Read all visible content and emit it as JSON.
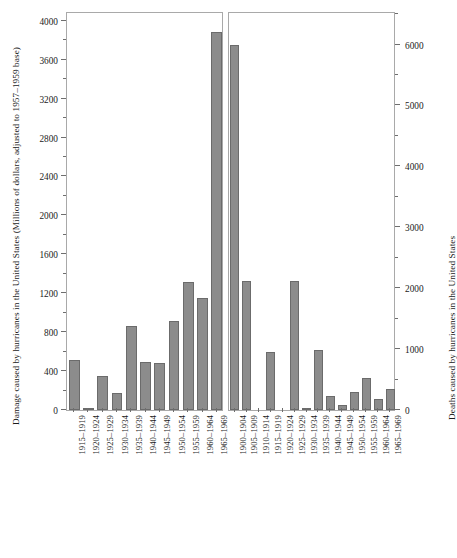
{
  "chart_data": {
    "type": "bar",
    "title": "",
    "panels": [
      {
        "id": "damage",
        "ylabel": "Damage caused by hurricanes in the United States (Millions of dollars, adjusted to 1957–1959 base)",
        "xlabel": "",
        "ylim": [
          0,
          4100
        ],
        "ytick_major": [
          0,
          400,
          800,
          1200,
          1600,
          2000,
          2400,
          2800,
          3200,
          3600,
          4000
        ],
        "ytick_major_labels": [
          "0",
          "400",
          "800",
          "1200",
          "1600",
          "2000",
          "2400",
          "2800",
          "3200",
          "3600",
          "4000"
        ],
        "ytick_minor": [
          200,
          600,
          1000,
          1400,
          1800,
          2200,
          2600,
          3000,
          3400,
          3800
        ],
        "axis_side": "left",
        "grid": false,
        "categories": [
          "1915–1919",
          "1920–1924",
          "1925–1929",
          "1930–1934",
          "1935–1939",
          "1940–1944",
          "1945–1949",
          "1950–1954",
          "1955–1959",
          "1960–1964",
          "1965–1969"
        ],
        "values": [
          510,
          25,
          345,
          170,
          860,
          495,
          480,
          910,
          1320,
          1150,
          3880
        ]
      },
      {
        "id": "deaths",
        "ylabel": "Deaths caused by hurricanes in the United States",
        "xlabel": "",
        "ylim": [
          0,
          6550
        ],
        "ytick_major": [
          0,
          1000,
          2000,
          3000,
          4000,
          5000,
          6000
        ],
        "ytick_major_labels": [
          "0",
          "1000",
          "2000",
          "3000",
          "4000",
          "5000",
          "6000"
        ],
        "ytick_minor": [
          500,
          1500,
          2500,
          3500,
          4500,
          5500,
          6500
        ],
        "axis_side": "right",
        "grid": false,
        "categories": [
          "1900–1904",
          "1905–1909",
          "1910–1914",
          "1915–1919",
          "1920–1924",
          "1925–1929",
          "1930–1934",
          "1935–1939",
          "1940–1944",
          "1945–1949",
          "1950–1954",
          "1955–1959",
          "1960–1964",
          "1965–1969"
        ],
        "values": [
          6000,
          2120,
          0,
          960,
          0,
          2110,
          20,
          980,
          230,
          90,
          290,
          530,
          175,
          350
        ]
      }
    ],
    "style": {
      "bar_fill": "#8c8c8c",
      "bar_edge": "#6b6b6b",
      "panel_edge": "#a9a9a9",
      "background": "#ffffff",
      "text_color": "#1a1a1a"
    }
  }
}
